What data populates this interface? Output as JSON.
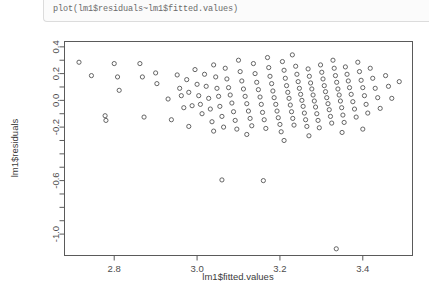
{
  "console": {
    "command": "plot(lm1$residuals~lm1$fitted.values)"
  },
  "chart_data": {
    "type": "scatter",
    "title": "",
    "xlabel": "lm1$fitted.values",
    "ylabel": "lm1$residuals",
    "xlim": [
      2.68,
      3.52
    ],
    "ylim": [
      -1.16,
      0.44
    ],
    "xticks": [
      2.8,
      3.0,
      3.2,
      3.4
    ],
    "xticklabels": [
      "2.8",
      "3.0",
      "3.2",
      "3.4"
    ],
    "yticks": [
      0.4,
      0.2,
      0.0,
      -0.2,
      -0.6,
      -1.0
    ],
    "yticklabels": [
      "0.4",
      "0.2",
      "0.0",
      "-0.2",
      "-0.6",
      "-1.0"
    ],
    "yminorticks": [
      0.3,
      0.1,
      -0.1,
      -0.3,
      -0.4,
      -0.5,
      -0.7,
      -0.8,
      -0.9
    ],
    "grid": false,
    "legend": null,
    "marker": "open-circle",
    "marker_color": "#555555",
    "n_points": 158,
    "points": [
      [
        2.715,
        0.285
      ],
      [
        2.745,
        0.185
      ],
      [
        2.778,
        -0.115
      ],
      [
        2.78,
        -0.15
      ],
      [
        2.8,
        0.275
      ],
      [
        2.808,
        0.175
      ],
      [
        2.812,
        0.075
      ],
      [
        2.862,
        0.275
      ],
      [
        2.868,
        0.175
      ],
      [
        2.872,
        -0.125
      ],
      [
        2.9,
        0.205
      ],
      [
        2.903,
        0.125
      ],
      [
        2.93,
        0.01
      ],
      [
        2.938,
        -0.145
      ],
      [
        2.952,
        0.19
      ],
      [
        2.958,
        0.09
      ],
      [
        2.962,
        0.035
      ],
      [
        2.968,
        -0.055
      ],
      [
        2.975,
        0.155
      ],
      [
        2.98,
        0.06
      ],
      [
        2.988,
        -0.04
      ],
      [
        2.995,
        0.23
      ],
      [
        3.0,
        0.12
      ],
      [
        3.004,
        0.035
      ],
      [
        3.008,
        -0.03
      ],
      [
        3.012,
        -0.1
      ],
      [
        3.018,
        0.195
      ],
      [
        3.022,
        0.105
      ],
      [
        3.028,
        0.015
      ],
      [
        3.032,
        -0.065
      ],
      [
        3.036,
        -0.16
      ],
      [
        3.04,
        0.265
      ],
      [
        3.045,
        0.175
      ],
      [
        3.048,
        0.09
      ],
      [
        3.052,
        0.03
      ],
      [
        3.055,
        -0.045
      ],
      [
        3.06,
        -0.12
      ],
      [
        3.064,
        -0.2
      ],
      [
        3.068,
        0.24
      ],
      [
        3.072,
        0.16
      ],
      [
        3.076,
        0.095
      ],
      [
        3.08,
        0.04
      ],
      [
        3.084,
        -0.02
      ],
      [
        3.088,
        -0.085
      ],
      [
        3.092,
        -0.15
      ],
      [
        3.096,
        -0.215
      ],
      [
        3.1,
        0.3
      ],
      [
        3.104,
        0.215
      ],
      [
        3.108,
        0.145
      ],
      [
        3.112,
        0.085
      ],
      [
        3.116,
        0.03
      ],
      [
        3.12,
        -0.025
      ],
      [
        3.124,
        -0.08
      ],
      [
        3.128,
        -0.135
      ],
      [
        3.132,
        -0.19
      ],
      [
        3.136,
        0.275
      ],
      [
        3.14,
        0.2
      ],
      [
        3.144,
        0.135
      ],
      [
        3.148,
        0.08
      ],
      [
        3.152,
        0.025
      ],
      [
        3.155,
        -0.03
      ],
      [
        3.158,
        -0.09
      ],
      [
        3.162,
        -0.145
      ],
      [
        3.166,
        -0.21
      ],
      [
        3.17,
        0.32
      ],
      [
        3.173,
        0.245
      ],
      [
        3.176,
        0.18
      ],
      [
        3.18,
        0.125
      ],
      [
        3.183,
        0.07
      ],
      [
        3.186,
        0.02
      ],
      [
        3.19,
        -0.03
      ],
      [
        3.193,
        -0.08
      ],
      [
        3.196,
        -0.13
      ],
      [
        3.2,
        -0.18
      ],
      [
        3.203,
        -0.235
      ],
      [
        3.206,
        0.29
      ],
      [
        3.21,
        0.225
      ],
      [
        3.213,
        0.165
      ],
      [
        3.216,
        0.11
      ],
      [
        3.219,
        0.06
      ],
      [
        3.222,
        0.015
      ],
      [
        3.225,
        -0.035
      ],
      [
        3.228,
        -0.085
      ],
      [
        3.231,
        -0.135
      ],
      [
        3.234,
        -0.185
      ],
      [
        3.238,
        0.255
      ],
      [
        3.241,
        0.195
      ],
      [
        3.244,
        0.14
      ],
      [
        3.247,
        0.09
      ],
      [
        3.25,
        0.045
      ],
      [
        3.253,
        0.0
      ],
      [
        3.256,
        -0.045
      ],
      [
        3.259,
        -0.095
      ],
      [
        3.262,
        -0.145
      ],
      [
        3.265,
        -0.195
      ],
      [
        3.268,
        0.235
      ],
      [
        3.271,
        0.18
      ],
      [
        3.274,
        0.13
      ],
      [
        3.277,
        0.085
      ],
      [
        3.28,
        0.04
      ],
      [
        3.283,
        -0.005
      ],
      [
        3.286,
        -0.05
      ],
      [
        3.289,
        -0.1
      ],
      [
        3.292,
        -0.15
      ],
      [
        3.295,
        -0.205
      ],
      [
        3.298,
        0.265
      ],
      [
        3.301,
        0.21
      ],
      [
        3.304,
        0.16
      ],
      [
        3.307,
        0.11
      ],
      [
        3.31,
        0.065
      ],
      [
        3.313,
        0.02
      ],
      [
        3.316,
        -0.025
      ],
      [
        3.319,
        -0.07
      ],
      [
        3.322,
        -0.12
      ],
      [
        3.325,
        -0.17
      ],
      [
        3.328,
        0.3
      ],
      [
        3.331,
        0.24
      ],
      [
        3.334,
        0.185
      ],
      [
        3.337,
        0.135
      ],
      [
        3.34,
        0.085
      ],
      [
        3.343,
        0.04
      ],
      [
        3.346,
        -0.005
      ],
      [
        3.349,
        -0.055
      ],
      [
        3.352,
        -0.11
      ],
      [
        3.355,
        -0.165
      ],
      [
        3.358,
        0.25
      ],
      [
        3.362,
        0.195
      ],
      [
        3.365,
        0.145
      ],
      [
        3.368,
        0.095
      ],
      [
        3.372,
        0.045
      ],
      [
        3.376,
        -0.01
      ],
      [
        3.38,
        -0.065
      ],
      [
        3.384,
        -0.125
      ],
      [
        3.388,
        0.285
      ],
      [
        3.392,
        0.215
      ],
      [
        3.396,
        0.15
      ],
      [
        3.4,
        0.095
      ],
      [
        3.404,
        0.035
      ],
      [
        3.408,
        -0.03
      ],
      [
        3.412,
        -0.095
      ],
      [
        3.418,
        0.24
      ],
      [
        3.424,
        0.165
      ],
      [
        3.43,
        0.09
      ],
      [
        3.436,
        0.02
      ],
      [
        3.442,
        -0.06
      ],
      [
        3.455,
        0.185
      ],
      [
        3.462,
        0.105
      ],
      [
        3.47,
        0.015
      ],
      [
        3.488,
        0.14
      ],
      [
        3.06,
        -0.595
      ],
      [
        3.16,
        -0.6
      ],
      [
        3.336,
        -1.11
      ],
      [
        2.98,
        -0.195
      ],
      [
        3.04,
        -0.23
      ],
      [
        3.12,
        -0.255
      ],
      [
        3.21,
        -0.3
      ],
      [
        3.27,
        -0.265
      ],
      [
        3.35,
        -0.24
      ],
      [
        3.4,
        -0.215
      ],
      [
        3.23,
        0.34
      ]
    ]
  }
}
